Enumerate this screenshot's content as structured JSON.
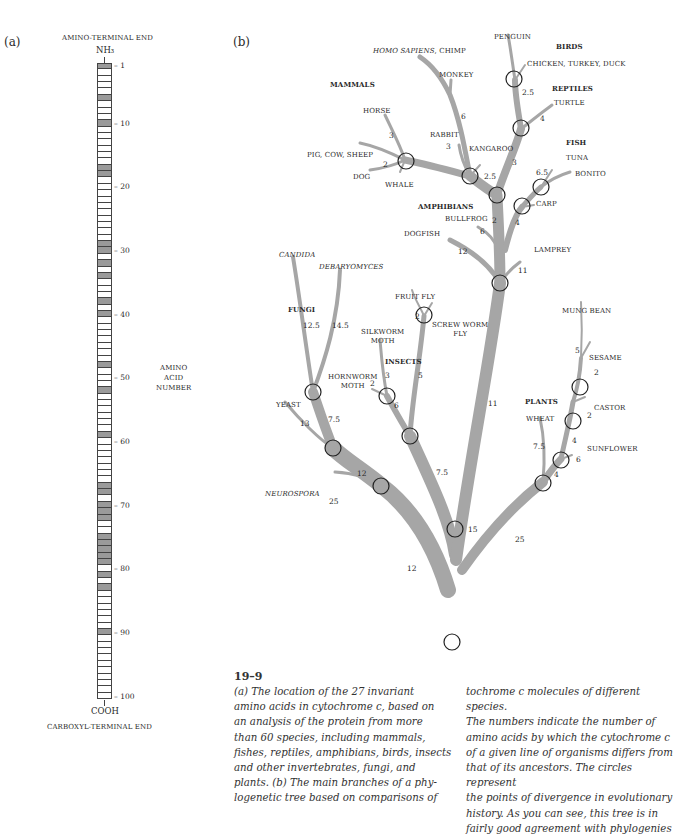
{
  "panel_a": {
    "label": "(a)",
    "top_label": "AMINO-TERMINAL END",
    "top_group": "NH₃",
    "bottom_group": "COOH",
    "bottom_label": "CARBOXYL-TERMINAL END",
    "axis_label": [
      "AMINO",
      "ACID",
      "NUMBER"
    ],
    "residue_count": 100,
    "invariant_residues": [
      1,
      6,
      10,
      17,
      18,
      29,
      30,
      32,
      34,
      38,
      40,
      48,
      52,
      59,
      67,
      68,
      70,
      71,
      72,
      75,
      76,
      77,
      78,
      79,
      81,
      83,
      90
    ],
    "ticks": [
      "1",
      "10",
      "20",
      "30",
      "40",
      "50",
      "60",
      "70",
      "80",
      "90",
      "100"
    ],
    "colors": {
      "invariant": "#9a9a9a",
      "variable": "#ffffff",
      "outline": "#444444"
    }
  },
  "panel_b": {
    "label": "(b)",
    "groups": {
      "mammals": "MAMMALS",
      "birds": "BIRDS",
      "reptiles": "REPTILES",
      "fish": "FISH",
      "amphibians": "AMPHIBIANS",
      "fungi": "FUNGI",
      "insects": "INSECTS",
      "plants": "PLANTS"
    },
    "species": {
      "homo": "HOMO SAPIENS",
      "chimp": ", CHIMP",
      "monkey": "MONKEY",
      "horse": "HORSE",
      "pig": "PIG, COW, SHEEP",
      "dog": "DOG",
      "whale": "WHALE",
      "rabbit": "RABBIT",
      "kangaroo": "KANGAROO",
      "penguin": "PENGUIN",
      "chicken": "CHICKEN, TURKEY, DUCK",
      "turtle": "TURTLE",
      "tuna": "TUNA",
      "bonito": "BONITO",
      "carp": "CARP",
      "bullfrog": "BULLFROG",
      "dogfish": "DOGFISH",
      "lamprey": "LAMPREY",
      "candida": "CANDIDA",
      "debaryomyces": "DEBARYOMYCES",
      "yeast": "YEAST",
      "neurospora": "NEUROSPORA",
      "fruitfly": "FRUIT FLY",
      "screwworm1": "SCREW WORM",
      "screwworm2": "FLY",
      "silkworm1": "SILKWORM",
      "silkworm2": "MOTH",
      "hornworm1": "HORNWORM",
      "hornworm2": "MOTH",
      "mungbean": "MUNG BEAN",
      "sesame": "SESAME",
      "castor": "CASTOR",
      "sunflower": "SUNFLOWER",
      "wheat": "WHEAT"
    },
    "distances": {
      "monkey": "6",
      "horse": "3",
      "pig": "2",
      "rabbit": "3",
      "kangaroo": "2.5",
      "chicken": "2.5",
      "turtle": "4",
      "mammal_stem": "3",
      "tuna": "6.5",
      "carp": "4",
      "bullfrog": "6",
      "amph_stem": "2",
      "dogfish": "12",
      "lamprey": "11",
      "candida": "12.5",
      "debaryomyces": "14.5",
      "yeast": "13",
      "fungi_stem": "7.5",
      "fungi_lower": "12",
      "neurospora": "25",
      "fungi_base": "12",
      "fruitfly": "2",
      "screwworm": "5",
      "silkworm": "3",
      "hornworm": "2",
      "insect_stem": "6",
      "insect_base": "7.5",
      "vert_stem": "11",
      "animal_base": "15",
      "mungbean": "5",
      "sesame": "2",
      "castor": "2",
      "castor_stem": "4",
      "sunflower": "6",
      "sunflower_stem": "4",
      "wheat": "7.5",
      "plant_base": "25"
    },
    "colors": {
      "branch": "#a6a6a6",
      "node": "#222222"
    }
  },
  "caption": {
    "number": "19–9",
    "col1": [
      "(a) The location of the 27 invariant",
      "amino acids in cytochrome c, based on",
      "an analysis of the protein from more",
      "than 60 species, including mammals,",
      "fishes, reptiles, amphibians, birds, insects",
      "and other invertebrates, fungi, and",
      "plants. (b) The main branches of a phy-",
      "logenetic tree based on comparisons of"
    ],
    "col2": [
      "tochrome c molecules of different species.",
      "The numbers indicate the number of",
      "amino acids by which the cytochrome c",
      "of a given line of organisms differs from",
      "that of its ancestors. The circles represent",
      "the points of divergence in evolutionary",
      "history. As you can see, this tree is in",
      "fairly good agreement with phylogenies"
    ]
  }
}
